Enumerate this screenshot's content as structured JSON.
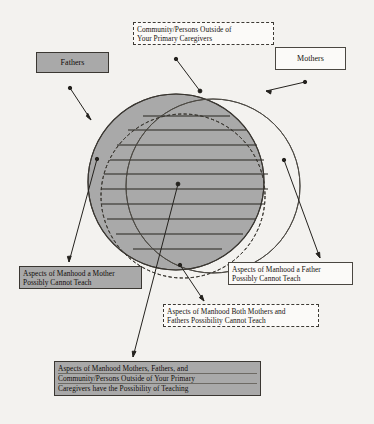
{
  "diagram": {
    "type": "venn-three-set",
    "colors": {
      "page_background": "#f3f2ef",
      "shaded_fill": "#a9a9a9",
      "white_fill": "#fbfaf8",
      "line": "#3a3732"
    },
    "sets": [
      {
        "id": "fathers",
        "label": "Fathers",
        "style": "shaded-solid",
        "shape": "circle"
      },
      {
        "id": "mothers",
        "label": "Mothers",
        "style": "white-solid",
        "shape": "circle"
      },
      {
        "id": "community",
        "label": "Community/Persons Outside of Your Primary Caregivers",
        "label_lines": [
          "Community/Persons Outside of",
          "Your Primary Caregivers"
        ],
        "style": "dashed",
        "shape": "circle"
      }
    ],
    "regions": [
      {
        "id": "mother-cannot-teach",
        "style": "shaded-solid",
        "label_lines": [
          "Aspects of Manhood a Mother",
          "Possibly Cannot Teach"
        ]
      },
      {
        "id": "father-cannot-teach",
        "style": "white-solid",
        "label_lines": [
          "Aspects of Manhood a Father",
          "Possibly Cannot Teach"
        ]
      },
      {
        "id": "both-cannot-teach",
        "style": "dashed",
        "label_lines": [
          "Aspects of Manhood Both Mothers and",
          "Fathers Possibility Cannot Teach"
        ]
      },
      {
        "id": "all-can-teach",
        "style": "shaded-ruled",
        "label_lines": [
          "Aspects of Manhood Mothers, Fathers, and",
          "Community/Persons Outside of Your Primary",
          "Caregivers have the Possibility of Teaching"
        ]
      }
    ],
    "callouts": [
      {
        "id": "fathers-arrow",
        "from": "fathers-label",
        "to": "fathers-circle-edge"
      },
      {
        "id": "mothers-arrow",
        "from": "mothers-label",
        "to": "mothers-circle-edge"
      },
      {
        "id": "community-arrow",
        "from": "community-label",
        "to": "community-circle-top"
      },
      {
        "id": "mother-cannot-arrow",
        "from": "fathers-only-region",
        "to": "mother-cannot-label"
      },
      {
        "id": "father-cannot-arrow",
        "from": "mothers-only-region",
        "to": "father-cannot-label"
      },
      {
        "id": "both-cannot-arrow",
        "from": "fathers-mothers-overlap",
        "to": "both-cannot-label"
      },
      {
        "id": "all-can-arrow",
        "from": "triple-overlap-center",
        "to": "all-can-label"
      }
    ]
  }
}
